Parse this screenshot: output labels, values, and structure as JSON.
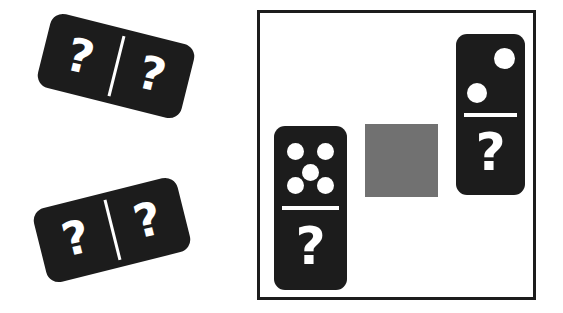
{
  "scene": {
    "title": "Domino matching puzzle",
    "background_color": "#ffffff",
    "tile_color": "#1c1c1c",
    "pip_color": "#ffffff",
    "unknown_symbol": "?"
  },
  "loose_tiles": [
    {
      "id": "loose-domino-1",
      "orientation": "horizontal",
      "rotation_deg": 14,
      "halves": [
        {
          "position": "left",
          "value": "?"
        },
        {
          "position": "right",
          "value": "?"
        }
      ]
    },
    {
      "id": "loose-domino-2",
      "orientation": "horizontal",
      "rotation_deg": -14,
      "halves": [
        {
          "position": "left",
          "value": "?"
        },
        {
          "position": "right",
          "value": "?"
        }
      ]
    }
  ],
  "panel": {
    "border_color": "#1c1c1c",
    "background_color": "#ffffff",
    "placeholder": {
      "name": "gray-square",
      "color": "#717171",
      "label": ""
    },
    "tiles": [
      {
        "id": "panel-domino-left",
        "orientation": "vertical",
        "top_half": {
          "type": "pips",
          "count": 5,
          "arrangement": "quincunx"
        },
        "bottom_half": {
          "type": "unknown",
          "value": "?"
        }
      },
      {
        "id": "panel-domino-right",
        "orientation": "vertical",
        "top_half": {
          "type": "pips",
          "count": 2,
          "arrangement": "diagonal-tr-bl"
        },
        "bottom_half": {
          "type": "unknown",
          "value": "?"
        }
      }
    ]
  }
}
